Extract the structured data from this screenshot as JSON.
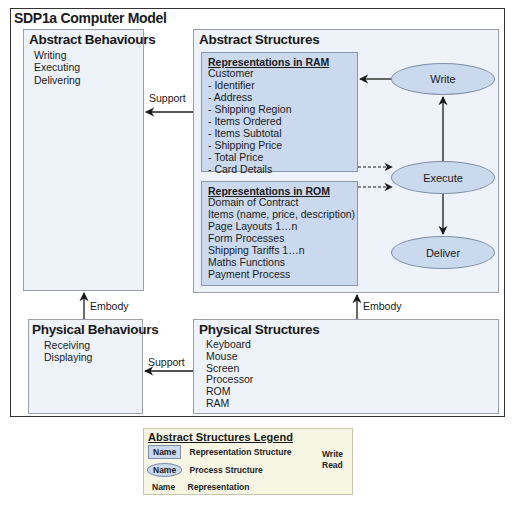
{
  "title": "SDP1a Computer Model",
  "abstract_behaviours": {
    "heading": "Abstract Behaviours",
    "items": [
      "Writing",
      "Executing",
      "Delivering"
    ]
  },
  "abstract_structures": {
    "heading": "Abstract Structures",
    "ram": {
      "heading": "Representations in RAM",
      "items": [
        "Customer",
        "- Identifier",
        "- Address",
        "- Shipping Region",
        "- Items Ordered",
        "- Items Subtotal",
        "- Shipping Price",
        "- Total Price",
        "- Card Details"
      ]
    },
    "rom": {
      "heading": "Representations in ROM",
      "items": [
        "Domain of Contract",
        "Items (name, price, description)",
        "Page Layouts 1…n",
        "Form Processes",
        "Shipping Tariffs 1…n",
        "Maths Functions",
        "Payment Process"
      ]
    },
    "processes": {
      "write": "Write",
      "execute": "Execute",
      "deliver": "Deliver"
    }
  },
  "physical_behaviours": {
    "heading": "Physical Behaviours",
    "items": [
      "Receiving",
      "Displaying"
    ]
  },
  "physical_structures": {
    "heading": "Physical Structures",
    "items": [
      "Keyboard",
      "Mouse",
      "Screen",
      "Processor",
      "ROM",
      "RAM"
    ]
  },
  "connectors": {
    "support_top": "Support",
    "support_bottom": "Support",
    "embody_left": "Embody",
    "embody_right": "Embody"
  },
  "legend": {
    "heading": "Abstract Structures Legend",
    "sample": "Name",
    "representation_structure": "Representation Structure",
    "process_structure": "Process Structure",
    "representation": "Representation",
    "write": "Write",
    "read": "Read"
  },
  "colors": {
    "box_fill": "#eef3fa",
    "representation_fill": "#cad9ee",
    "legend_fill": "#f7f5e4",
    "frame": "#333333"
  }
}
